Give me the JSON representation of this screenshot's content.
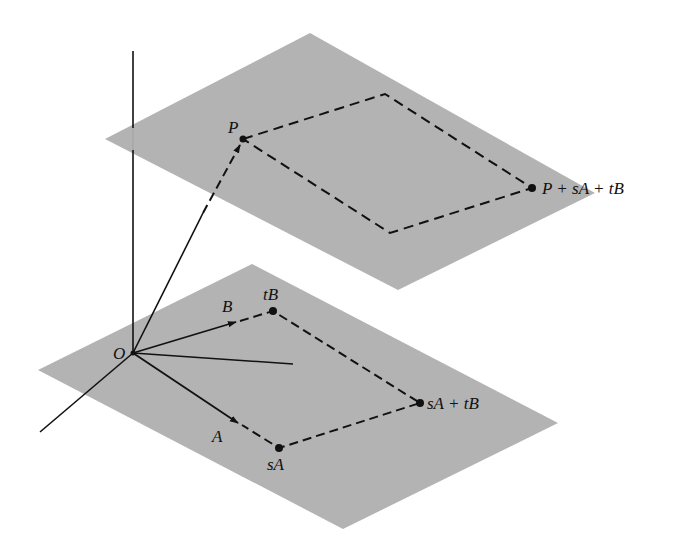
{
  "figure": {
    "colors": {
      "plane": "#b3b3b3",
      "ink": "#111111",
      "background": "#ffffff"
    },
    "labels": {
      "origin": "O",
      "vector_a": "A",
      "vector_b": "B",
      "point_p": "P",
      "point_sa": "sA",
      "point_tb": "tB",
      "point_sa_tb": "sA + tB",
      "point_p_sa_tb": "P + sA + tB"
    },
    "upper_plane": {
      "corners": [
        [
          310,
          33
        ],
        [
          595,
          193
        ],
        [
          398,
          290
        ],
        [
          105,
          139
        ]
      ]
    },
    "lower_plane": {
      "corners": [
        [
          252,
          264
        ],
        [
          558,
          423
        ],
        [
          343,
          529
        ],
        [
          38,
          370
        ]
      ]
    }
  }
}
